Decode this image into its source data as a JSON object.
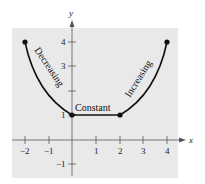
{
  "axes": {
    "x_label": "x",
    "y_label": "y",
    "x_ticks": [
      "−2",
      "−1",
      "1",
      "2",
      "3",
      "4"
    ],
    "y_ticks": [
      "4",
      "3",
      "1",
      "−1"
    ]
  },
  "annotations": {
    "decreasing": "Decreasing",
    "constant": "Constant",
    "increasing": "Increasing"
  },
  "points": [
    {
      "x": -2,
      "y": 4
    },
    {
      "x": 0,
      "y": 1
    },
    {
      "x": 2,
      "y": 1
    },
    {
      "x": 4,
      "y": 4
    }
  ],
  "colors": {
    "background": "#e9e9e9",
    "curve": "#111111"
  }
}
